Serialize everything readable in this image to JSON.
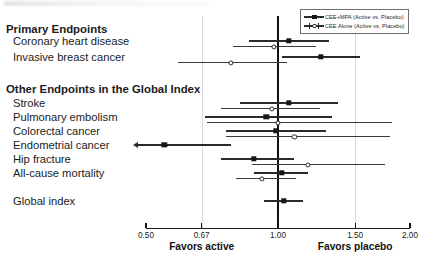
{
  "figure": {
    "type": "forest-plot",
    "width": 433,
    "height": 261
  },
  "legend": {
    "position": "top-right",
    "entries": [
      {
        "label": "CEE+MPA (Active vs. Placebo)",
        "marker": "filled-square",
        "color": "#151515"
      },
      {
        "label": "CEE Alone (Active vs. Placebo)",
        "marker": "open-circle",
        "color": "#2b2b2b"
      }
    ]
  },
  "axis": {
    "scale": "log",
    "min": 0.5,
    "max": 2.0,
    "ticks": [
      0.5,
      0.67,
      1.0,
      1.5,
      2.0
    ],
    "tick_labels": [
      "0.50",
      "0.67",
      "1.00",
      "1.50",
      "2.00"
    ],
    "reference_value": 1.0,
    "gridlines": [
      0.67,
      1.5
    ],
    "left_caption": "Favors active",
    "left_caption_at": 0.67,
    "right_caption": "Favors placebo",
    "right_caption_at": 1.5
  },
  "sections": [
    {
      "title": "Primary Endpoints"
    },
    {
      "title": "Other Endpoints in the Global Index"
    }
  ],
  "rows": [
    {
      "label": "Primary Endpoints",
      "kind": "header",
      "y": 32
    },
    {
      "label": "Coronary heart disease",
      "kind": "data",
      "y": 44
    },
    {
      "label": "Invasive breast cancer",
      "kind": "data",
      "y": 60
    },
    {
      "label": "Other Endpoints in the Global Index",
      "kind": "header",
      "y": 92
    },
    {
      "label": "Stroke",
      "kind": "data",
      "y": 106
    },
    {
      "label": "Pulmonary embolism",
      "kind": "data",
      "y": 120
    },
    {
      "label": "Colorectal cancer",
      "kind": "data",
      "y": 134
    },
    {
      "label": "Endometrial cancer",
      "kind": "data",
      "y": 148
    },
    {
      "label": "Hip fracture",
      "kind": "data",
      "y": 162
    },
    {
      "label": "All-cause mortality",
      "kind": "data",
      "y": 176
    },
    {
      "label": "Global index",
      "kind": "data",
      "y": 204
    }
  ],
  "chart_data": {
    "type": "forest",
    "title": "",
    "xlabel": "Hazard ratio",
    "ylabel": "",
    "xscale": "log",
    "xlim": [
      0.5,
      2.0
    ],
    "xticks": [
      0.5,
      0.67,
      1.0,
      1.5,
      2.0
    ],
    "reference_line": 1.0,
    "grid": true,
    "legend_position": "top-right",
    "series": [
      {
        "name": "CEE+MPA (Active vs. Placebo)",
        "marker": "filled-square",
        "points": [
          {
            "endpoint": "Coronary heart disease",
            "estimate": 1.06,
            "ci_low": 0.86,
            "ci_high": 1.31,
            "truncated_low": false
          },
          {
            "endpoint": "Invasive breast cancer",
            "estimate": 1.25,
            "ci_low": 1.02,
            "ci_high": 1.54,
            "truncated_low": false
          },
          {
            "endpoint": "Stroke",
            "estimate": 1.06,
            "ci_low": 0.82,
            "ci_high": 1.37,
            "truncated_low": false
          },
          {
            "endpoint": "Pulmonary embolism",
            "estimate": 0.94,
            "ci_low": 0.68,
            "ci_high": 1.33,
            "truncated_low": false
          },
          {
            "endpoint": "Colorectal cancer",
            "estimate": 0.99,
            "ci_low": 0.76,
            "ci_high": 1.29,
            "truncated_low": false
          },
          {
            "endpoint": "Endometrial cancer",
            "estimate": 0.55,
            "ci_low": 0.5,
            "ci_high": 0.78,
            "truncated_low": true
          },
          {
            "endpoint": "Hip fracture",
            "estimate": 0.88,
            "ci_low": 0.74,
            "ci_high": 1.09,
            "truncated_low": false
          },
          {
            "endpoint": "All-cause mortality",
            "estimate": 1.02,
            "ci_low": 0.88,
            "ci_high": 1.17,
            "truncated_low": false
          },
          {
            "endpoint": "Global index",
            "estimate": 1.03,
            "ci_low": 0.93,
            "ci_high": 1.14,
            "truncated_low": false
          }
        ]
      },
      {
        "name": "CEE Alone (Active vs. Placebo)",
        "marker": "open-circle",
        "points": [
          {
            "endpoint": "Coronary heart disease",
            "estimate": 0.98,
            "ci_low": 0.79,
            "ci_high": 1.22,
            "truncated_low": false
          },
          {
            "endpoint": "Invasive breast cancer",
            "estimate": 0.78,
            "ci_low": 0.59,
            "ci_high": 1.05,
            "truncated_low": false
          },
          {
            "endpoint": "Stroke",
            "estimate": 0.97,
            "ci_low": 0.74,
            "ci_high": 1.25,
            "truncated_low": false
          },
          {
            "endpoint": "Pulmonary embolism",
            "estimate": 1.0,
            "ci_low": 0.69,
            "ci_high": 1.82,
            "truncated_low": false
          },
          {
            "endpoint": "Colorectal cancer",
            "estimate": 1.09,
            "ci_low": 0.76,
            "ci_high": 1.8,
            "truncated_low": false
          },
          {
            "endpoint": "Hip fracture",
            "estimate": 1.17,
            "ci_low": 0.87,
            "ci_high": 1.75,
            "truncated_low": false
          },
          {
            "endpoint": "All-cause mortality",
            "estimate": 0.92,
            "ci_low": 0.8,
            "ci_high": 1.1,
            "truncated_low": false
          }
        ]
      }
    ]
  }
}
